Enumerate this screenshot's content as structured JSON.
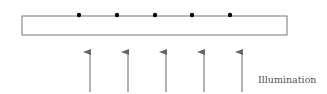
{
  "diagram": {
    "plate": {
      "x": 22,
      "y": 16,
      "width": 265,
      "height": 19,
      "stroke": "#777777"
    },
    "particles": {
      "count": 5,
      "x": [
        79,
        117,
        155,
        192,
        230
      ],
      "y": 15,
      "color": "#000000"
    },
    "arrows": {
      "count": 5,
      "x": [
        90,
        128,
        166,
        204,
        242
      ],
      "y_start": 92,
      "y_end": 52,
      "color": "#666666",
      "direction": "up"
    },
    "label": "Illumination"
  }
}
